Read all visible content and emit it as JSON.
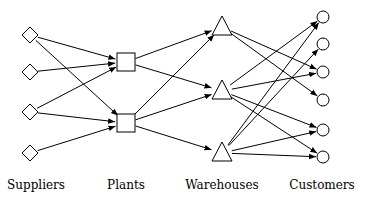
{
  "diagram": {
    "type": "supply-chain-network",
    "stroke_color": "#000000",
    "background": "#ffffff",
    "tiers": [
      {
        "id": "suppliers",
        "label": "Suppliers",
        "shape": "diamond",
        "label_x": 36
      },
      {
        "id": "plants",
        "label": "Plants",
        "shape": "square",
        "label_x": 126
      },
      {
        "id": "warehouses",
        "label": "Warehouses",
        "shape": "triangle",
        "label_x": 222
      },
      {
        "id": "customers",
        "label": "Customers",
        "shape": "circle",
        "label_x": 322
      }
    ],
    "nodes": [
      {
        "id": "S1",
        "tier": "suppliers",
        "x": 30,
        "y": 35
      },
      {
        "id": "S2",
        "tier": "suppliers",
        "x": 30,
        "y": 72
      },
      {
        "id": "S3",
        "tier": "suppliers",
        "x": 30,
        "y": 112
      },
      {
        "id": "S4",
        "tier": "suppliers",
        "x": 30,
        "y": 153
      },
      {
        "id": "P1",
        "tier": "plants",
        "x": 126,
        "y": 62
      },
      {
        "id": "P2",
        "tier": "plants",
        "x": 126,
        "y": 123
      },
      {
        "id": "W1",
        "tier": "warehouses",
        "x": 222,
        "y": 27
      },
      {
        "id": "W2",
        "tier": "warehouses",
        "x": 222,
        "y": 91
      },
      {
        "id": "W3",
        "tier": "warehouses",
        "x": 222,
        "y": 153
      },
      {
        "id": "C1",
        "tier": "customers",
        "x": 323,
        "y": 17
      },
      {
        "id": "C2",
        "tier": "customers",
        "x": 323,
        "y": 44
      },
      {
        "id": "C3",
        "tier": "customers",
        "x": 323,
        "y": 72
      },
      {
        "id": "C4",
        "tier": "customers",
        "x": 323,
        "y": 100
      },
      {
        "id": "C5",
        "tier": "customers",
        "x": 323,
        "y": 130
      },
      {
        "id": "C6",
        "tier": "customers",
        "x": 323,
        "y": 157
      }
    ],
    "edges": [
      {
        "from": "S1",
        "to": "P1"
      },
      {
        "from": "S1",
        "to": "P2"
      },
      {
        "from": "S2",
        "to": "P1"
      },
      {
        "from": "S3",
        "to": "P1"
      },
      {
        "from": "S3",
        "to": "P2"
      },
      {
        "from": "S4",
        "to": "P2"
      },
      {
        "from": "P1",
        "to": "W1"
      },
      {
        "from": "P1",
        "to": "W2"
      },
      {
        "from": "P2",
        "to": "W1"
      },
      {
        "from": "P2",
        "to": "W2"
      },
      {
        "from": "P2",
        "to": "W3"
      },
      {
        "from": "W1",
        "to": "C3"
      },
      {
        "from": "W1",
        "to": "C4"
      },
      {
        "from": "W2",
        "to": "C1"
      },
      {
        "from": "W2",
        "to": "C3"
      },
      {
        "from": "W2",
        "to": "C5"
      },
      {
        "from": "W2",
        "to": "C6"
      },
      {
        "from": "W3",
        "to": "C1"
      },
      {
        "from": "W3",
        "to": "C2"
      },
      {
        "from": "W3",
        "to": "C5"
      },
      {
        "from": "W3",
        "to": "C6"
      }
    ]
  }
}
